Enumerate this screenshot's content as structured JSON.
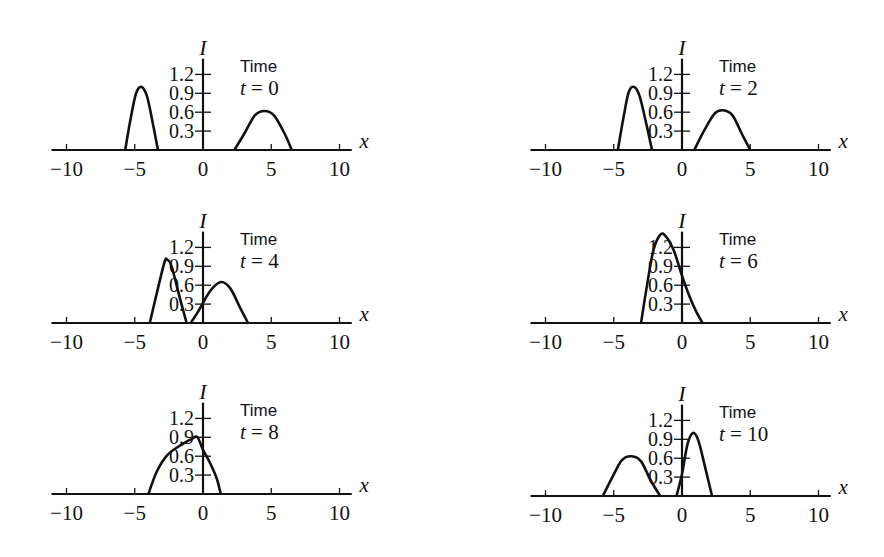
{
  "chart_data": {
    "type": "line",
    "title": "",
    "layout": {
      "rows": 3,
      "cols": 2,
      "grid": false,
      "legend": "none"
    },
    "shared": {
      "xlabel": "x",
      "ylabel": "I",
      "xlim": [
        -10,
        10
      ],
      "ylim": [
        0,
        1.3
      ],
      "x_ticks": [
        -10,
        -5,
        0,
        5,
        10
      ],
      "x_tick_labels": [
        "−10",
        "−5",
        "0",
        "5",
        "10"
      ],
      "y_ticks": [
        0.3,
        0.6,
        0.9,
        1.2
      ],
      "y_tick_labels": [
        "0.3",
        "0.6",
        "0.9",
        "1.2"
      ],
      "annotation_title": "Time"
    },
    "panels": [
      {
        "label_time": "t = 0",
        "t": 0,
        "series": [
          {
            "name": "left pulse",
            "points": [
              [
                -5.7,
                0
              ],
              [
                -5.3,
                0.5
              ],
              [
                -4.9,
                0.9
              ],
              [
                -4.5,
                1.0
              ],
              [
                -4.1,
                0.85
              ],
              [
                -3.7,
                0.45
              ],
              [
                -3.3,
                0
              ]
            ]
          },
          {
            "name": "right pulse",
            "points": [
              [
                2.3,
                0
              ],
              [
                3.0,
                0.25
              ],
              [
                3.8,
                0.55
              ],
              [
                4.5,
                0.62
              ],
              [
                5.2,
                0.55
              ],
              [
                6.0,
                0.25
              ],
              [
                6.5,
                0
              ]
            ]
          }
        ]
      },
      {
        "label_time": "t = 2",
        "t": 2,
        "series": [
          {
            "name": "left pulse",
            "points": [
              [
                -4.7,
                0
              ],
              [
                -4.3,
                0.5
              ],
              [
                -3.9,
                0.92
              ],
              [
                -3.5,
                1.0
              ],
              [
                -3.1,
                0.85
              ],
              [
                -2.6,
                0.4
              ],
              [
                -2.2,
                0
              ]
            ]
          },
          {
            "name": "right pulse",
            "points": [
              [
                0.9,
                0
              ],
              [
                1.6,
                0.3
              ],
              [
                2.4,
                0.58
              ],
              [
                3.0,
                0.63
              ],
              [
                3.7,
                0.55
              ],
              [
                4.4,
                0.25
              ],
              [
                5.0,
                0
              ]
            ]
          }
        ]
      },
      {
        "label_time": "t = 4",
        "t": 4,
        "series": [
          {
            "name": "left pulse",
            "points": [
              [
                -3.9,
                0
              ],
              [
                -3.3,
                0.55
              ],
              [
                -2.8,
                0.98
              ],
              [
                -2.6,
                1.0
              ],
              [
                -2.3,
                0.9
              ],
              [
                -1.7,
                0.4
              ],
              [
                -1.2,
                0
              ]
            ]
          },
          {
            "name": "right pulse",
            "points": [
              [
                -0.9,
                0
              ],
              [
                -0.3,
                0.2
              ],
              [
                0.5,
                0.5
              ],
              [
                1.3,
                0.65
              ],
              [
                2.0,
                0.55
              ],
              [
                2.7,
                0.25
              ],
              [
                3.3,
                0
              ]
            ]
          }
        ]
      },
      {
        "label_time": "t = 6",
        "t": 6,
        "series": [
          {
            "name": "combined pulse",
            "points": [
              [
                -3.0,
                0
              ],
              [
                -2.6,
                0.55
              ],
              [
                -2.1,
                1.15
              ],
              [
                -1.6,
                1.4
              ],
              [
                -1.2,
                1.38
              ],
              [
                -0.6,
                1.15
              ],
              [
                0,
                0.75
              ],
              [
                0.5,
                0.45
              ],
              [
                1.0,
                0.2
              ],
              [
                1.5,
                0
              ]
            ]
          }
        ]
      },
      {
        "label_time": "t = 8",
        "t": 8,
        "series": [
          {
            "name": "combined pulse",
            "points": [
              [
                -4.0,
                0
              ],
              [
                -3.4,
                0.35
              ],
              [
                -2.6,
                0.62
              ],
              [
                -1.6,
                0.78
              ],
              [
                -0.8,
                0.88
              ],
              [
                -0.4,
                0.9
              ],
              [
                0,
                0.7
              ],
              [
                0.5,
                0.5
              ],
              [
                1.0,
                0.25
              ],
              [
                1.3,
                0
              ]
            ]
          }
        ]
      },
      {
        "label_time": "t = 10",
        "t": 10,
        "series": [
          {
            "name": "left pulse",
            "points": [
              [
                -5.8,
                0
              ],
              [
                -5.1,
                0.3
              ],
              [
                -4.4,
                0.57
              ],
              [
                -3.7,
                0.63
              ],
              [
                -3.0,
                0.55
              ],
              [
                -2.3,
                0.25
              ],
              [
                -1.6,
                0
              ]
            ]
          },
          {
            "name": "right pulse",
            "points": [
              [
                -0.4,
                0
              ],
              [
                0,
                0.35
              ],
              [
                0.4,
                0.82
              ],
              [
                0.8,
                1.0
              ],
              [
                1.2,
                0.88
              ],
              [
                1.7,
                0.45
              ],
              [
                2.2,
                0
              ]
            ]
          }
        ]
      }
    ]
  },
  "panels_geometry": [
    {
      "x0": 203,
      "base": 150
    },
    {
      "x0": 682,
      "base": 150
    },
    {
      "x0": 203,
      "base": 323
    },
    {
      "x0": 682,
      "base": 323
    },
    {
      "x0": 203,
      "base": 494
    },
    {
      "x0": 682,
      "base": 496
    }
  ]
}
